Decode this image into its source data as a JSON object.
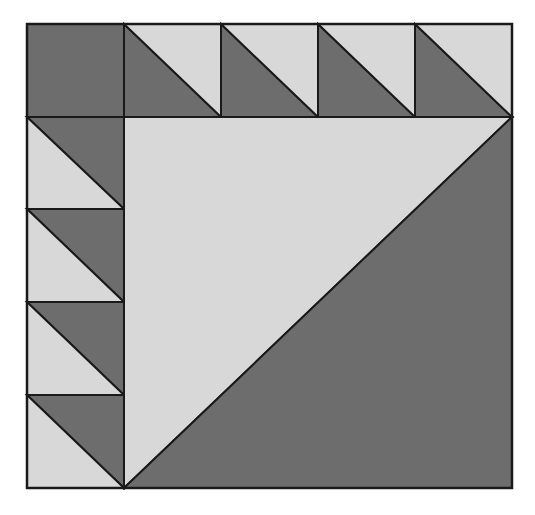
{
  "diagram": {
    "colors": {
      "dark": "#6d6d6d",
      "light": "#d8d8d8",
      "stroke": "#1a1a1a",
      "background": "#ffffff"
    },
    "grid": {
      "x": [
        27,
        124,
        221,
        318,
        415,
        512
      ],
      "y": [
        24,
        117,
        209,
        302,
        395,
        488
      ]
    },
    "top_row": [
      {
        "type": "solid",
        "fill": "dark"
      },
      {
        "type": "hst",
        "lower_left": "dark",
        "upper_right": "light"
      },
      {
        "type": "hst",
        "lower_left": "dark",
        "upper_right": "light"
      },
      {
        "type": "hst",
        "lower_left": "dark",
        "upper_right": "light"
      },
      {
        "type": "hst",
        "lower_left": "dark",
        "upper_right": "light"
      }
    ],
    "left_column": [
      {
        "type": "hst",
        "upper_right": "dark",
        "lower_left": "light"
      },
      {
        "type": "hst",
        "upper_right": "dark",
        "lower_left": "light"
      },
      {
        "type": "hst",
        "upper_right": "dark",
        "lower_left": "light"
      },
      {
        "type": "hst",
        "upper_right": "dark",
        "lower_left": "light"
      }
    ],
    "center": {
      "type": "hst",
      "upper_left": "light",
      "lower_right": "dark"
    }
  }
}
